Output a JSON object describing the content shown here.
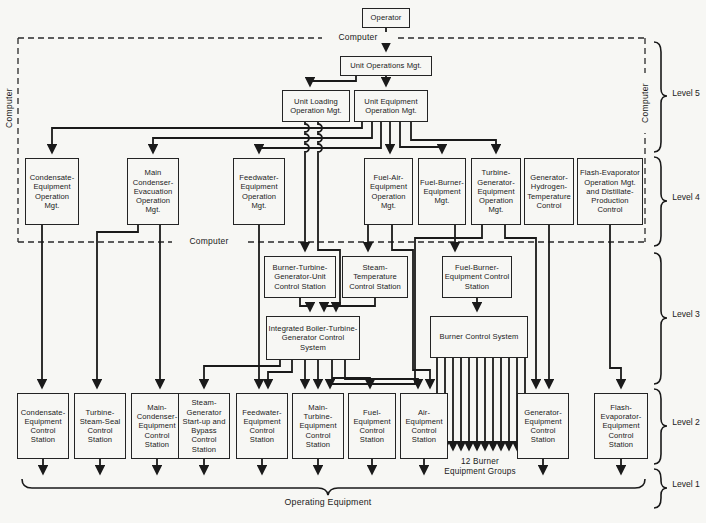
{
  "diagram": {
    "operator": "Operator",
    "computer_label": "Computer",
    "level5": {
      "unit_operations": "Unit Operations Mgt.",
      "unit_loading": "Unit Loading Operation Mgt.",
      "unit_equipment": "Unit Equipment Operation Mgt."
    },
    "level4": [
      "Condensate-Equipment Operation Mgt.",
      "Main Condenser-Evacuation Operation Mgt.",
      "Feedwater-Equipment Operation Mgt.",
      "Fuel-Air-Equipment Operation Mgt.",
      "Fuel-Burner-Equipment Mgt.",
      "Turbine-Generator-Equipment Operation Mgt.",
      "Generator-Hydrogen-Temperature Control",
      "Flash-Evaporator Operation Mgt. and Distillate-Production Control"
    ],
    "level3": [
      "Burner-Turbine-Generator-Unit Control Station",
      "Steam-Temperature Control Station",
      "Fuel-Burner-Equipment Control Station",
      "Integrated Boiler-Turbine-Generator Control System",
      "Burner Control System"
    ],
    "level2": [
      "Condensate-Equipment Control Station",
      "Turbine-Steam-Seal Control Station",
      "Main-Condenser-Equipment Control Station",
      "Steam-Generator Start-up and Bypass Control Station",
      "Feedwater-Equipment Control Station",
      "Main-Turbine-Equipment Control Station",
      "Fuel-Equipment Control Station",
      "Air-Equipment Control Station",
      "Generator-Equipment Control Station",
      "Flash-Evaporator-Equipment Control Station"
    ],
    "burner_groups_label": "12 Burner Equipment Groups",
    "operating_equipment": "Operating Equipment",
    "levels": [
      "Level 5",
      "Level 4",
      "Level 3",
      "Level 2",
      "Level 1"
    ]
  }
}
